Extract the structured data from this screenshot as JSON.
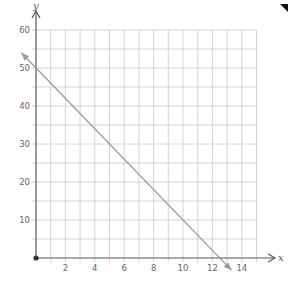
{
  "chart_data": {
    "type": "line",
    "title": "",
    "xlabel": "x",
    "ylabel": "y",
    "xlim": [
      0,
      15
    ],
    "ylim": [
      0,
      60
    ],
    "x_ticks": [
      2,
      4,
      6,
      8,
      10,
      12,
      14
    ],
    "y_ticks": [
      10,
      20,
      30,
      40,
      50,
      60
    ],
    "grid": true,
    "grid_x_step": 1,
    "grid_y_step": 5,
    "legend": null,
    "series": [
      {
        "name": "line",
        "equation": "y = 50 - 4x",
        "points": [
          [
            0,
            50
          ],
          [
            12.5,
            0
          ]
        ],
        "y_intercept": 50,
        "x_intercept": 12.5,
        "slope": -4,
        "arrows": "both ends",
        "color": "#9a9a9a"
      }
    ],
    "origin_marker": true
  },
  "colors": {
    "grid": "#c9c9c9",
    "axis": "#555555",
    "line": "#9a9a9a",
    "corner_mark": "#111111"
  }
}
